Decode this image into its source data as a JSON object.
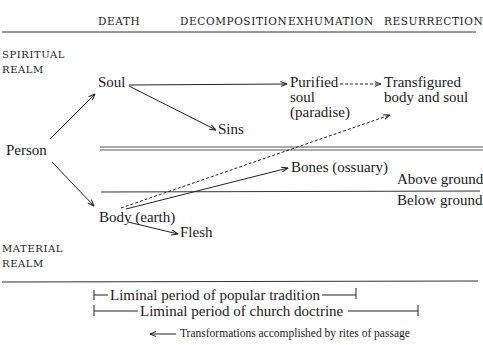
{
  "figure": {
    "caption_partial": "FIGURE 4"
  },
  "columns": [
    "DEATH",
    "DECOMPOSITION",
    "EXHUMATION",
    "RESURRECTION"
  ],
  "realms": {
    "spiritual": [
      "SPIRITUAL",
      "REALM"
    ],
    "material": [
      "MATERIAL",
      "REALM"
    ]
  },
  "nodes": {
    "person": "Person",
    "soul": "Soul",
    "sins": "Sins",
    "purified_soul": [
      "Purified",
      "soul",
      "(paradise)"
    ],
    "transfigured": [
      "Transfigured",
      "body and soul"
    ],
    "body": "Body (earth)",
    "flesh": "Flesh",
    "bones": "Bones (ossuary)"
  },
  "ground": {
    "above": "Above ground",
    "below": "Below ground"
  },
  "periods": {
    "popular": "Liminal period of popular tradition",
    "church": "Liminal period of church doctrine"
  },
  "legend": {
    "arrow_label": "Transformations accomplished by rites of passage"
  },
  "edges": [
    {
      "from": "person",
      "to": "soul",
      "style": "solid"
    },
    {
      "from": "person",
      "to": "body",
      "style": "solid"
    },
    {
      "from": "soul",
      "to": "purified_soul",
      "style": "solid"
    },
    {
      "from": "soul",
      "to": "sins",
      "style": "solid"
    },
    {
      "from": "purified_soul",
      "to": "transfigured",
      "style": "dashed"
    },
    {
      "from": "body",
      "to": "transfigured",
      "style": "dashed"
    },
    {
      "from": "body",
      "to": "bones",
      "style": "solid"
    },
    {
      "from": "body",
      "to": "flesh",
      "style": "solid"
    }
  ]
}
